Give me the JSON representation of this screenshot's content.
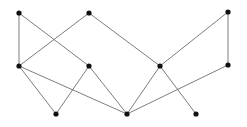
{
  "figure": {
    "background_color": "#ffffff",
    "node_color": "#111111",
    "edge_color": "#6e6e6e",
    "node_radius": 2.6,
    "edge_width": 0.9,
    "node_count": 11,
    "edge_count": 13,
    "width": 247,
    "height": 127
  },
  "chart_data": {
    "type": "diagram",
    "layout": "three-row layered graph",
    "nodes": [
      {
        "id": "t1",
        "label": "",
        "row": "top",
        "x": 19,
        "y": 13
      },
      {
        "id": "t2",
        "label": "",
        "row": "top",
        "x": 89,
        "y": 13
      },
      {
        "id": "t3",
        "label": "",
        "row": "top",
        "x": 228,
        "y": 12
      },
      {
        "id": "m1",
        "label": "",
        "row": "middle",
        "x": 19,
        "y": 66
      },
      {
        "id": "m2",
        "label": "",
        "row": "middle",
        "x": 89,
        "y": 66
      },
      {
        "id": "m3",
        "label": "",
        "row": "middle",
        "x": 160,
        "y": 66
      },
      {
        "id": "m4",
        "label": "",
        "row": "middle",
        "x": 228,
        "y": 65
      },
      {
        "id": "b1",
        "label": "",
        "row": "bottom",
        "x": 56,
        "y": 114
      },
      {
        "id": "b2",
        "label": "",
        "row": "bottom",
        "x": 127,
        "y": 114
      },
      {
        "id": "b3",
        "label": "",
        "row": "bottom",
        "x": 196,
        "y": 114
      }
    ],
    "edges": [
      {
        "source": "t1",
        "target": "m1"
      },
      {
        "source": "t1",
        "target": "m2"
      },
      {
        "source": "t2",
        "target": "m1"
      },
      {
        "source": "t2",
        "target": "m3"
      },
      {
        "source": "t3",
        "target": "m3"
      },
      {
        "source": "t3",
        "target": "m4"
      },
      {
        "source": "m1",
        "target": "b1"
      },
      {
        "source": "m1",
        "target": "b2"
      },
      {
        "source": "m2",
        "target": "b1"
      },
      {
        "source": "m2",
        "target": "b2"
      },
      {
        "source": "m3",
        "target": "b2"
      },
      {
        "source": "m3",
        "target": "b3"
      },
      {
        "source": "m4",
        "target": "b2"
      }
    ]
  }
}
